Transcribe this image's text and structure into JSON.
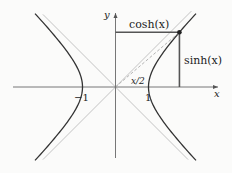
{
  "diagram": {
    "parameter_x": 1.28,
    "axes": {
      "x_label": "x",
      "y_label": "y"
    },
    "ticks": {
      "neg_one": "−1",
      "pos_one": "1"
    },
    "labels": {
      "cosh": "cosh(x)",
      "sinh": "sinh(x)",
      "angle": "x/2"
    },
    "colors": {
      "axis": "#555555",
      "hyperbola": "#333333",
      "asymptote": "#c4c4c4",
      "segment": "#555555",
      "ray": "#aaaaaa"
    }
  }
}
